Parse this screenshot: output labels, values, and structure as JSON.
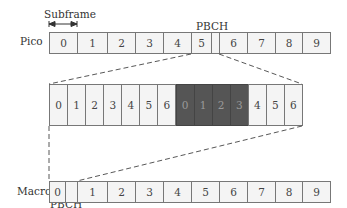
{
  "labels": {
    "subframe": "Subframe",
    "pico": "Pico",
    "macro": "Macro",
    "pbch_top": "PBCH",
    "pbch_bottom": "PBCH"
  },
  "pico_row": {
    "cells": [
      {
        "text": "0",
        "x": 49,
        "w": 28
      },
      {
        "text": "1",
        "x": 77,
        "w": 30
      },
      {
        "text": "2",
        "x": 107,
        "w": 28
      },
      {
        "text": "3",
        "x": 135,
        "w": 28
      },
      {
        "text": "4",
        "x": 163,
        "w": 28
      },
      {
        "text": "5",
        "x": 191,
        "w": 20
      },
      {
        "text": "",
        "x": 211,
        "w": 8,
        "pbch": true
      },
      {
        "text": "6",
        "x": 219,
        "w": 28
      },
      {
        "text": "7",
        "x": 247,
        "w": 28
      },
      {
        "text": "8",
        "x": 275,
        "w": 27
      },
      {
        "text": "9",
        "x": 302,
        "w": 28
      }
    ]
  },
  "expanded_row": {
    "cells": [
      {
        "text": "0",
        "dark": false
      },
      {
        "text": "1",
        "dark": false
      },
      {
        "text": "2",
        "dark": false
      },
      {
        "text": "3",
        "dark": false
      },
      {
        "text": "4",
        "dark": false
      },
      {
        "text": "5",
        "dark": false
      },
      {
        "text": "6",
        "dark": false
      },
      {
        "text": "0",
        "dark": true
      },
      {
        "text": "1",
        "dark": true
      },
      {
        "text": "2",
        "dark": true
      },
      {
        "text": "3",
        "dark": true
      },
      {
        "text": "4",
        "dark": false
      },
      {
        "text": "5",
        "dark": false
      },
      {
        "text": "6",
        "dark": false
      }
    ]
  },
  "macro_row": {
    "cells": [
      {
        "text": "0",
        "x": 49,
        "w": 16
      },
      {
        "text": "",
        "x": 65,
        "w": 12,
        "pbch": true
      },
      {
        "text": "1",
        "x": 77,
        "w": 30
      },
      {
        "text": "2",
        "x": 107,
        "w": 28
      },
      {
        "text": "3",
        "x": 135,
        "w": 28
      },
      {
        "text": "4",
        "x": 163,
        "w": 28
      },
      {
        "text": "5",
        "x": 191,
        "w": 28
      },
      {
        "text": "6",
        "x": 219,
        "w": 28
      },
      {
        "text": "7",
        "x": 247,
        "w": 28
      },
      {
        "text": "8",
        "x": 275,
        "w": 27
      },
      {
        "text": "9",
        "x": 302,
        "w": 28
      }
    ]
  },
  "colors": {
    "cell_fill": "#f4f4f4",
    "dark_fill": "#555555",
    "border": "#777777"
  }
}
